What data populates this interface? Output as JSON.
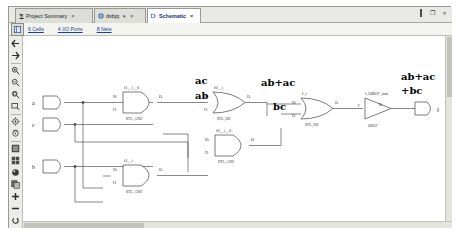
{
  "window": {
    "controls": [
      {
        "name": "maximize",
        "glyph": "□"
      },
      {
        "name": "restore",
        "glyph": "❐"
      },
      {
        "name": "close",
        "glyph": "×"
      }
    ]
  },
  "tabs": [
    {
      "label": "Project Summary",
      "icon": "sigma-icon",
      "active": false,
      "close": "×"
    },
    {
      "label": "dsbjq",
      "icon": "globe-icon",
      "active": false,
      "close": "×",
      "extra": "▾"
    },
    {
      "label": "Schematic",
      "icon": "schematic-icon",
      "active": true,
      "close": "×"
    }
  ],
  "infobar": {
    "toggle_icon": "panel-toggle-icon",
    "items": [
      {
        "label": "6 Cells"
      },
      {
        "label": "4 I/O Ports"
      },
      {
        "label": "8 Nets"
      }
    ]
  },
  "toolbar": {
    "items": [
      {
        "name": "back-icon",
        "glyph": "←"
      },
      {
        "name": "forward-icon",
        "glyph": "→"
      },
      {
        "name": "zoom-in-icon",
        "glyph": "zoom-in"
      },
      {
        "name": "zoom-out-icon",
        "glyph": "zoom-out"
      },
      {
        "name": "zoom-fit-icon",
        "glyph": "zoom-fit"
      },
      {
        "name": "zoom-area-icon",
        "glyph": "zoom-area"
      },
      {
        "name": "expand-cone-icon",
        "glyph": "cone"
      },
      {
        "name": "collapse-cone-icon",
        "glyph": "cone2"
      },
      {
        "name": "select-block-icon",
        "glyph": "block"
      },
      {
        "name": "select-grid-icon",
        "glyph": "grid"
      },
      {
        "name": "highlight-icon",
        "glyph": "highlight"
      },
      {
        "name": "copy-icon",
        "glyph": "copy"
      },
      {
        "name": "add-icon",
        "glyph": "+"
      },
      {
        "name": "remove-icon",
        "glyph": "−"
      },
      {
        "name": "refresh-icon",
        "glyph": "refresh"
      }
    ]
  },
  "schematic": {
    "inputs": [
      {
        "label": "a"
      },
      {
        "label": "c"
      },
      {
        "label": "b"
      }
    ],
    "output": {
      "label": "f"
    },
    "gates": [
      {
        "id": "and1",
        "inst": "f1__i__0",
        "type": "RTL_AND",
        "in0": "I0",
        "in1": "I1",
        "out": "O"
      },
      {
        "id": "and2",
        "inst": "f1__i",
        "type": "RTL_AND",
        "in0": "I0",
        "in1": "I1",
        "out": "O"
      },
      {
        "id": "and3",
        "inst": "f0__i__0",
        "type": "RTL_AND",
        "in0": "I0",
        "in1": "I1",
        "out": "O"
      },
      {
        "id": "or1",
        "inst": "f0__i",
        "type": "RTL_OR",
        "in0": "I0",
        "in1": "I1",
        "out": "O"
      },
      {
        "id": "or2",
        "inst": "f_i",
        "type": "RTL_OR",
        "in0": "I0",
        "in1": "I1",
        "out": "O"
      },
      {
        "id": "obuf",
        "inst": "f_OBUF_inst",
        "type": "OBUF",
        "in0": "I",
        "out": "O"
      }
    ],
    "annotations": [
      {
        "id": "anno-ac",
        "text": "ac"
      },
      {
        "id": "anno-ab",
        "text": "ab"
      },
      {
        "id": "anno-abac",
        "text": "ab+ac"
      },
      {
        "id": "anno-bc",
        "text": "bc"
      },
      {
        "id": "anno-out1",
        "text": "ab+ac"
      },
      {
        "id": "anno-out2",
        "text": "+bc"
      }
    ]
  },
  "colors": {
    "active_tab_text": "#16307c",
    "link": "#1b3fa0",
    "frame": "#9a9a94",
    "canvas": "#ffffff"
  }
}
